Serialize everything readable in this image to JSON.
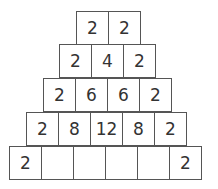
{
  "pyramid": {
    "rows": [
      {
        "cells": [
          "2",
          "2"
        ]
      },
      {
        "cells": [
          "2",
          "4",
          "2"
        ]
      },
      {
        "cells": [
          "2",
          "6",
          "6",
          "2"
        ]
      },
      {
        "cells": [
          "2",
          "8",
          "12",
          "8",
          "2"
        ]
      },
      {
        "cells": [
          "2",
          "",
          "",
          "",
          "",
          "2"
        ]
      }
    ]
  }
}
